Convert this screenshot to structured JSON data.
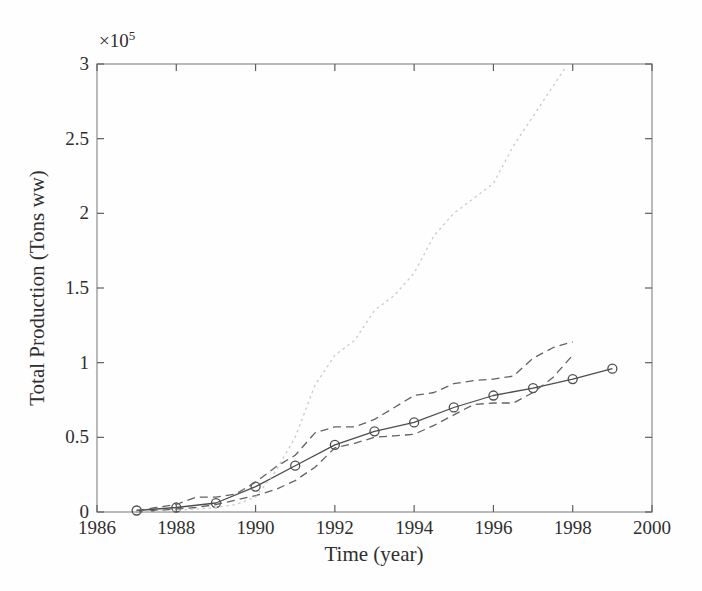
{
  "figure": {
    "background_color": "#fefefe",
    "axis_box_color": "#8c8c8c",
    "tick_color": "#5f5f5f",
    "text_color": "#2f2f2f"
  },
  "chart_data": {
    "type": "line",
    "title": "",
    "xlabel": "Time (year)",
    "ylabel": "Total Production (Tons ww)",
    "y_scale_base": "×10",
    "y_scale_exponent": "5",
    "xlim": [
      1986,
      2000
    ],
    "ylim": [
      0,
      3
    ],
    "xticks": [
      1986,
      1988,
      1990,
      1992,
      1994,
      1996,
      1998,
      2000
    ],
    "yticks": [
      0,
      0.5,
      1,
      1.5,
      2,
      2.5,
      3
    ],
    "grid": false,
    "legend": null,
    "series": [
      {
        "name": "observed-cumulative-production",
        "style": "solid",
        "marker": "circle",
        "color": "#4d4d4d",
        "x": [
          1987,
          1988,
          1989,
          1990,
          1991,
          1992,
          1993,
          1994,
          1995,
          1996,
          1997,
          1998,
          1999
        ],
        "y": [
          0.01,
          0.03,
          0.06,
          0.17,
          0.31,
          0.45,
          0.54,
          0.6,
          0.7,
          0.78,
          0.83,
          0.89,
          0.96
        ]
      },
      {
        "name": "simulation-upper-dashed",
        "style": "dashed",
        "marker": "none",
        "color": "#636363",
        "x": [
          1987,
          1987.5,
          1988,
          1988.5,
          1989,
          1989.5,
          1990,
          1990.5,
          1991,
          1991.5,
          1992,
          1992.5,
          1993,
          1993.5,
          1994,
          1994.5,
          1995,
          1995.5,
          1996,
          1996.5,
          1997,
          1997.5,
          1998
        ],
        "y": [
          0.01,
          0.03,
          0.05,
          0.1,
          0.1,
          0.12,
          0.2,
          0.3,
          0.38,
          0.53,
          0.57,
          0.57,
          0.62,
          0.7,
          0.78,
          0.8,
          0.86,
          0.88,
          0.89,
          0.91,
          1.03,
          1.1,
          1.14
        ]
      },
      {
        "name": "simulation-lower-dashed",
        "style": "dashed",
        "marker": "none",
        "color": "#636363",
        "x": [
          1987,
          1987.5,
          1988,
          1988.5,
          1989,
          1989.5,
          1990,
          1990.5,
          1991,
          1991.5,
          1992,
          1992.5,
          1993,
          1993.5,
          1994,
          1994.5,
          1995,
          1995.5,
          1996,
          1996.5,
          1997,
          1997.5,
          1998
        ],
        "y": [
          0.0,
          0.01,
          0.02,
          0.03,
          0.05,
          0.08,
          0.11,
          0.15,
          0.21,
          0.3,
          0.43,
          0.46,
          0.5,
          0.51,
          0.52,
          0.58,
          0.65,
          0.72,
          0.73,
          0.73,
          0.8,
          0.9,
          1.05
        ]
      },
      {
        "name": "simulation-dotted-light",
        "style": "dotted",
        "marker": "none",
        "color": "#c8ccc5",
        "x": [
          1987,
          1988,
          1989,
          1989.5,
          1990,
          1990.5,
          1991,
          1991.5,
          1992,
          1992.5,
          1993,
          1993.5,
          1994,
          1994.5,
          1995,
          1995.5,
          1996,
          1996.5,
          1997,
          1997.5,
          1997.8
        ],
        "y": [
          0.0,
          0.01,
          0.03,
          0.05,
          0.1,
          0.27,
          0.5,
          0.85,
          1.05,
          1.15,
          1.35,
          1.45,
          1.6,
          1.85,
          2.0,
          2.1,
          2.2,
          2.45,
          2.65,
          2.85,
          2.97
        ]
      }
    ]
  }
}
